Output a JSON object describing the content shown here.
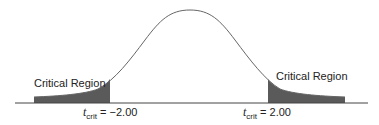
{
  "diagram": {
    "title": "",
    "distribution": "t distribution (two-tailed)",
    "colors": {
      "curve": "#555555",
      "shade": "#555555",
      "axis": "#444444",
      "text": "#222222"
    },
    "left_region": {
      "label": "Critical Region",
      "t_symbol": "t",
      "t_subscript": "crit",
      "value_text": "= −2.00",
      "value": -2.0
    },
    "right_region": {
      "label": "Critical Region",
      "t_symbol": "t",
      "t_subscript": "crit",
      "value_text": "= 2.00",
      "value": 2.0
    }
  }
}
